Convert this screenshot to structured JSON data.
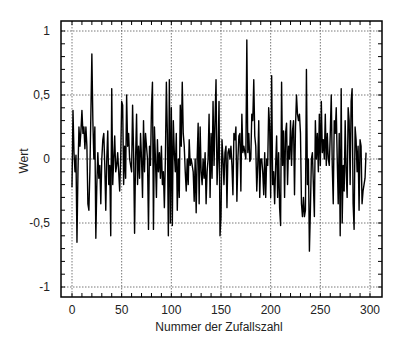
{
  "chart_data": {
    "type": "line",
    "title": "",
    "xlabel": "Nummer der Zufallszahl",
    "ylabel": "Wert",
    "xlim": [
      -5,
      305
    ],
    "ylim": [
      -1.05,
      1.1
    ],
    "grid": true,
    "legend": null,
    "x_ticks": [
      0,
      50,
      100,
      150,
      200,
      250,
      300
    ],
    "x_tick_labels": [
      "0",
      "50",
      "100",
      "150",
      "200",
      "250",
      "300"
    ],
    "y_ticks": [
      1,
      0.5,
      0,
      -0.5,
      -1
    ],
    "y_tick_labels": [
      "1",
      "0,5",
      "0",
      "-0,5",
      "-1"
    ],
    "line_color": "#000000",
    "series": [
      {
        "name": "Zufallszahlen",
        "x_start": 0,
        "x_step": 1,
        "values": [
          -0.22,
          0.38,
          0.05,
          -0.1,
          0.03,
          -0.65,
          -0.1,
          0.25,
          0.1,
          0.22,
          0.38,
          0.2,
          0.25,
          0.08,
          0.25,
          0.1,
          -0.35,
          -0.4,
          -0.1,
          0.35,
          0.82,
          0.3,
          0.0,
          0.25,
          -0.62,
          -0.2,
          0.05,
          -0.15,
          -0.05,
          -0.35,
          0.0,
          0.15,
          0.2,
          -0.05,
          -0.4,
          0.0,
          0.22,
          -0.2,
          -0.05,
          -0.6,
          0.55,
          -0.2,
          0.0,
          0.18,
          -0.1,
          -0.05,
          0.05,
          -0.1,
          -0.25,
          0.0,
          0.45,
          0.42,
          -0.2,
          0.1,
          -0.15,
          0.5,
          0.1,
          0.2,
          0.0,
          -0.05,
          -0.1,
          0.42,
          0.05,
          -0.58,
          0.0,
          0.35,
          -0.2,
          0.1,
          -0.15,
          0.2,
          0.0,
          -0.3,
          0.3,
          -0.1,
          0.2,
          0.1,
          0.0,
          -0.55,
          0.1,
          -0.05,
          0.4,
          0.6,
          -0.55,
          0.25,
          0.0,
          -0.3,
          0.15,
          -0.1,
          0.05,
          -0.15,
          0.1,
          -0.2,
          -0.1,
          -0.38,
          0.0,
          0.6,
          0.2,
          -0.6,
          0.62,
          -0.5,
          0.4,
          -0.52,
          0.3,
          0.05,
          -0.1,
          0.2,
          -0.4,
          0.0,
          -0.3,
          0.42,
          0.1,
          0.6,
          0.2,
          0.1,
          -0.1,
          -0.25,
          0.0,
          -0.2,
          0.15,
          -0.05,
          0.0,
          -0.05,
          -0.1,
          -0.33,
          0.0,
          -0.42,
          0.0,
          0.28,
          -0.35,
          0.25,
          -0.1,
          -0.2,
          0.0,
          -0.15,
          0.05,
          -0.35,
          -0.1,
          0.0,
          0.35,
          -0.3,
          0.2,
          -0.15,
          0.45,
          -0.05,
          0.3,
          0.62,
          -0.2,
          0.0,
          0.45,
          -0.6,
          -0.45,
          0.15,
          0.0,
          -0.2,
          0.05,
          0.1,
          -0.38,
          0.05,
          0.08,
          0.0,
          0.1,
          -0.05,
          -0.28,
          0.2,
          0.15,
          0.25,
          -0.33,
          0.0,
          0.18,
          0.2,
          -0.25,
          0.35,
          0.05,
          0.1,
          0.05,
          0.0,
          0.93,
          0.05,
          0.2,
          -0.02,
          0.0,
          0.35,
          0.3,
          0.62,
          0.18,
          0.1,
          -0.25,
          -0.05,
          0.3,
          -0.3,
          0.0,
          0.0,
          -0.1,
          -0.28,
          0.05,
          -0.3,
          0.0,
          -0.05,
          0.4,
          0.25,
          -0.3,
          0.65,
          -0.2,
          -0.1,
          -0.35,
          -0.05,
          0.18,
          -0.3,
          0.05,
          -0.38,
          -0.52,
          0.6,
          -0.05,
          0.22,
          -0.3,
          0.2,
          0.28,
          -0.2,
          0.1,
          0.0,
          0.3,
          -0.05,
          0.22,
          0.3,
          -0.28,
          0.25,
          0.5,
          0.35,
          0.3,
          0.35,
          0.2,
          -0.35,
          -0.45,
          -0.3,
          -0.45,
          -0.4,
          0.7,
          -0.2,
          0.0,
          -0.72,
          -0.4,
          0.0,
          0.05,
          -0.2,
          -0.45,
          0.3,
          0.0,
          0.2,
          -0.1,
          0.35,
          -0.05,
          0.45,
          0.05,
          0.15,
          0.0,
          0.35,
          -0.05,
          0.2,
          0.0,
          -0.05,
          0.2,
          0.5,
          -0.05,
          -0.35,
          0.3,
          0.2,
          0.4,
          0.0,
          -0.35,
          0.2,
          -0.6,
          0.55,
          -0.5,
          -0.05,
          -0.25,
          0.3,
          -0.1,
          -0.3,
          0.4,
          0.3,
          -0.2,
          0.45,
          0.55,
          -0.35,
          -0.55,
          0.25,
          0.15,
          -0.1,
          0.1,
          -0.4,
          0.15,
          0.1,
          -0.35,
          -0.25,
          -0.2,
          -0.15,
          0.05
        ]
      }
    ]
  }
}
